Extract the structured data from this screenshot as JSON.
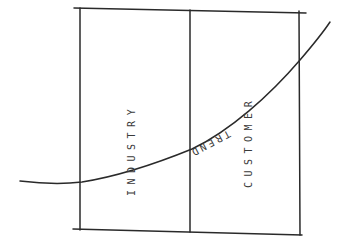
{
  "diagram": {
    "type": "hand-drawn matrix with trend curve",
    "columns": [
      {
        "id": "left",
        "label": "INDUSTRY"
      },
      {
        "id": "right",
        "label": "CUSTOMER"
      }
    ],
    "curve": {
      "label": "TREND"
    },
    "colors": {
      "ink": "#2a2a2a",
      "background": "#ffffff"
    }
  }
}
